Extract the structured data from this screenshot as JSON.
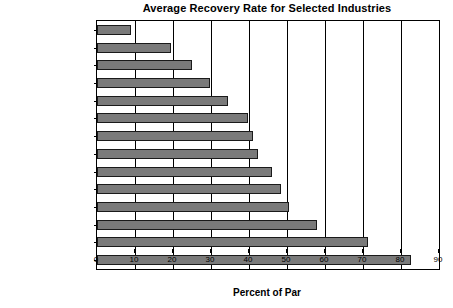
{
  "chart_data": {
    "type": "bar",
    "orientation": "horizontal",
    "title": "Average Recovery Rate for Selected Industries",
    "xlabel": "Percent of Par",
    "ylabel": "",
    "xlim": [
      0,
      90
    ],
    "xticks": [
      0,
      10,
      20,
      30,
      40,
      50,
      60,
      70,
      80,
      90
    ],
    "xtick_labels": [
      "0",
      "10",
      "20",
      "30",
      "40",
      "50",
      "60",
      "70",
      "80",
      "90"
    ],
    "grid": true,
    "grid_axis": "x",
    "legend": false,
    "bar_color": "#7a7a7a",
    "bar_edge_color": "#1a1a1a",
    "categories": [
      "Savings & Loans",
      "Oil & Gas Services",
      "Apparel",
      "Commercial Banks",
      "Real Estate",
      "Broadcasting",
      "Manufacturing",
      "Financial Services",
      "Food",
      "Retail Trade",
      "Machinery",
      "Chemicals",
      "Construction Contracting",
      "Gas Utilities"
    ],
    "values": [
      9,
      19.5,
      25,
      29.7,
      34.5,
      39.7,
      41,
      42.4,
      46,
      48.4,
      50.5,
      58,
      71.3,
      82.6
    ]
  }
}
